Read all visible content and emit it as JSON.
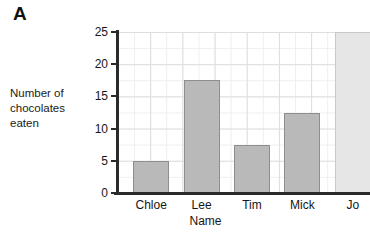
{
  "panel": {
    "letter": "A"
  },
  "axes": {
    "y_title_lines": [
      "Number of",
      "chocolates",
      "eaten"
    ],
    "x_title": "Name",
    "y_ticks": [
      "0",
      "5",
      "10",
      "15",
      "20",
      "25"
    ]
  },
  "chart_data": {
    "type": "bar",
    "title": "",
    "xlabel": "Name",
    "ylabel": "Number of chocolates eaten",
    "categories": [
      "Chloe",
      "Lee",
      "Tim",
      "Mick",
      "Jo"
    ],
    "values": [
      5,
      17.5,
      7.5,
      12.5,
      25
    ],
    "ylim": [
      0,
      25
    ],
    "ytick_step": 5,
    "grid": true,
    "legend": "none",
    "bar_colors": [
      "#b9b9b9",
      "#b9b9b9",
      "#b9b9b9",
      "#b9b9b9",
      "#e6e6e6"
    ]
  },
  "colors": {
    "bar_fill": "#b9b9b9",
    "bar_fill_light": "#e6e6e6",
    "bar_border": "#8e8e8e",
    "axis": "#2a2a2a",
    "grid_major": "#dedede",
    "grid_minor": "#f0eeee",
    "text": "#161616",
    "background": "#ffffff"
  }
}
